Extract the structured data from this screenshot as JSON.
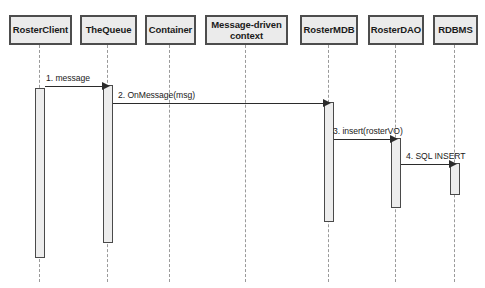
{
  "diagram": {
    "type": "uml-sequence-diagram",
    "participants": [
      {
        "name": "RosterClient",
        "label": "RosterClient",
        "x": 9,
        "y": 15,
        "width": 63,
        "height": 30,
        "lifeline_x": 40,
        "activation": {
          "top": 88,
          "bottom": 258,
          "width": 10
        }
      },
      {
        "name": "TheQueue",
        "label": "TheQueue",
        "x": 80,
        "y": 15,
        "width": 57,
        "height": 30,
        "lifeline_x": 108,
        "activation": {
          "top": 85,
          "bottom": 243,
          "width": 10
        }
      },
      {
        "name": "Container",
        "label": "Container",
        "x": 145,
        "y": 15,
        "width": 51,
        "height": 30,
        "lifeline_x": 170,
        "activation": null
      },
      {
        "name": "Message-driven context",
        "label": "Message-driven context",
        "x": 205,
        "y": 15,
        "width": 83,
        "height": 30,
        "lifeline_x": 246,
        "activation": null
      },
      {
        "name": "RosterMDB",
        "label": "RosterMDB",
        "x": 300,
        "y": 15,
        "width": 58,
        "height": 30,
        "lifeline_x": 329,
        "activation": {
          "top": 102,
          "bottom": 222,
          "width": 10
        }
      },
      {
        "name": "RosterDAO",
        "label": "RosterDAO",
        "x": 368,
        "y": 15,
        "width": 56,
        "height": 30,
        "lifeline_x": 396,
        "activation": {
          "top": 138,
          "bottom": 208,
          "width": 10
        }
      },
      {
        "name": "RDBMS",
        "label": "RDBMS",
        "x": 433,
        "y": 15,
        "width": 45,
        "height": 30,
        "lifeline_x": 455,
        "activation": {
          "top": 163,
          "bottom": 195,
          "width": 10
        }
      }
    ],
    "messages": [
      {
        "seq": "1",
        "label": "1. message",
        "from": "RosterClient",
        "to": "TheQueue",
        "y": 86,
        "from_x": 45,
        "to_x": 103,
        "label_x": 46,
        "label_y": 73
      },
      {
        "seq": "2",
        "label": "2. OnMessage(msg)",
        "from": "TheQueue",
        "to": "RosterMDB",
        "y": 103,
        "from_x": 113,
        "to_x": 324,
        "label_x": 118,
        "label_y": 90
      },
      {
        "seq": "3",
        "label": "3. insert(rosterVO)",
        "from": "RosterMDB",
        "to": "RosterDAO",
        "y": 139,
        "from_x": 334,
        "to_x": 391,
        "label_x": 333,
        "label_y": 126
      },
      {
        "seq": "4",
        "label": "4. SQL INSERT",
        "from": "RosterDAO",
        "to": "RDBMS",
        "y": 164,
        "from_x": 401,
        "to_x": 450,
        "label_x": 406,
        "label_y": 151
      }
    ],
    "colors": {
      "box_fill": "#ebebeb",
      "box_border": "#4d4d4d",
      "activation_fill": "#ededed",
      "activation_border": "#4a4a4a",
      "lifeline": "#9a9a9a",
      "arrow": "#2b2b2b",
      "text": "#1a1a1a",
      "background": "#ffffff"
    }
  }
}
